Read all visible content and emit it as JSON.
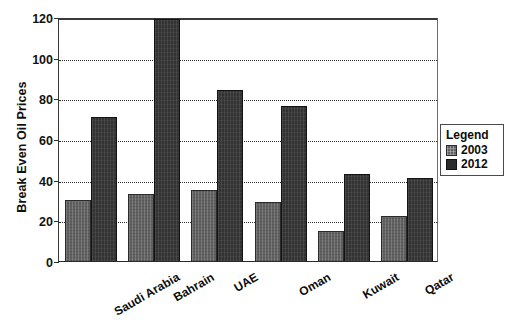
{
  "chart_data": {
    "type": "bar",
    "title": "",
    "subtitle": "",
    "xlabel": "",
    "ylabel": "Break Even Oil Prices",
    "categories": [
      "Saudi Arabia",
      "Bahrain",
      "UAE",
      "Oman",
      "Kuwait",
      "Qatar"
    ],
    "series": [
      {
        "name": "2003",
        "color": "#616161",
        "values": [
          30,
          33,
          35,
          29,
          15,
          22
        ]
      },
      {
        "name": "2012",
        "color": "#333333",
        "values": [
          71,
          119,
          84,
          76,
          43,
          41
        ]
      }
    ],
    "ylim": [
      0,
      120
    ],
    "yticks": [
      0,
      20,
      40,
      60,
      80,
      100,
      120
    ],
    "ytick_labels": [
      "0",
      "20",
      "40",
      "60",
      "80",
      "100",
      "120"
    ],
    "grid": true,
    "grid_style": "dotted",
    "legend_position": "right",
    "legend_title": "Legend",
    "xtick_rotation": -30
  },
  "legend": {
    "title": "Legend",
    "entries": [
      {
        "label": "2003",
        "swatch": "legend-swatch-2003"
      },
      {
        "label": "2012",
        "swatch": "legend-swatch-2012"
      }
    ]
  },
  "axes": {
    "y_title": "Break Even Oil Prices",
    "y_ticks": [
      "0",
      "20",
      "40",
      "60",
      "80",
      "100",
      "120"
    ],
    "x_categories": [
      "Saudi Arabia",
      "Bahrain",
      "UAE",
      "Oman",
      "Kuwait",
      "Qatar"
    ]
  },
  "colors": {
    "series_2003": "#616161",
    "series_2012": "#333333",
    "axis": "#2f2f2f",
    "grid": "#2b2b2b",
    "background": "#ffffff"
  }
}
